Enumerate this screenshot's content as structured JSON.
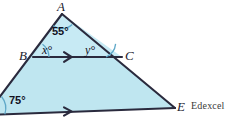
{
  "figure": {
    "type": "geometry-diagram",
    "shape": "triangle-with-parallel-lines",
    "fill_color": "#bfe6f0",
    "stroke_color": "#2a2a3d",
    "background_color": "#ffffff",
    "vertices": [
      {
        "name": "A",
        "label": "A",
        "x": 62,
        "y": 14
      },
      {
        "name": "B",
        "label": "B",
        "x": 33,
        "y": 57
      },
      {
        "name": "C",
        "label": "C",
        "x": 122,
        "y": 57
      },
      {
        "name": "E",
        "label": "E",
        "x": 175,
        "y": 108
      }
    ],
    "angles": [
      {
        "name": "angle-at-A",
        "label": "55°",
        "value": 55,
        "at": "A"
      },
      {
        "name": "angle-x-at-B",
        "label": "x°",
        "value": "x",
        "at": "B"
      },
      {
        "name": "angle-y-at-C",
        "label": "y°",
        "value": "y",
        "at": "C"
      },
      {
        "name": "angle-at-D",
        "label": "75°",
        "value": 75,
        "at": "bottom-left"
      }
    ],
    "parallel_lines": [
      {
        "name": "line-BC",
        "marker": "single-arrow"
      },
      {
        "name": "line-DE",
        "marker": "single-arrow"
      }
    ]
  },
  "attribution": {
    "text": "Edexcel"
  }
}
